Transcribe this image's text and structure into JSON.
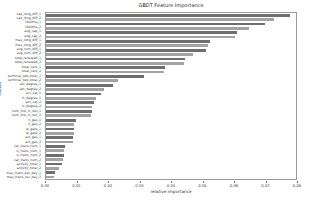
{
  "chart_data": {
    "type": "bar",
    "orientation": "horizontal",
    "title": "GBDT Feature Importance",
    "xlabel": "relative importance",
    "ylabel": "feature",
    "xlim": [
      0,
      0.08
    ],
    "xticks": [
      "0.00",
      "0.01",
      "0.02",
      "0.03",
      "0.04",
      "0.05",
      "0.06",
      "0.07",
      "0.08"
    ],
    "grid": false,
    "legend": "none",
    "bar_colors": [
      "#6f6f6f",
      "#a3a3a3"
    ],
    "categories": [
      "cap_long_diff_1",
      "cap_long_diff_2",
      "lifetime_1",
      "lifetime_2",
      "avg_cap_1",
      "avg_cap_2",
      "max_long_diff_1",
      "max_long_diff_2",
      "avg_turn_diff_1",
      "avg_turn_diff_2",
      "total_renewed_1",
      "total_renewed_2",
      "total_cars_1",
      "total_cars_2",
      "terminal_two_total_1",
      "terminal_two_total_2",
      "act_degree_1",
      "act_degree_2",
      "act_cat_1",
      "in_degree_1",
      "act_cat_2",
      "in_degree_2",
      "num_link_in_out_1",
      "num_link_in_out_2",
      "n_gas_1",
      "n_gas_2",
      "w_gate_1",
      "w_gate_2",
      "act_gas_1",
      "act_gas_2",
      "cat_trans_num_1",
      "si_trans_num_1",
      "si_trans_num_2",
      "cat_trans_num_2",
      "activity_total_1",
      "activity_total_2",
      "max_trans_per_day_1",
      "max_trans_rec_day_2"
    ],
    "values": [
      0.078,
      0.073,
      0.07,
      0.065,
      0.0612,
      0.0605,
      0.0524,
      0.0518,
      0.0512,
      0.047,
      0.0446,
      0.044,
      0.0382,
      0.0376,
      0.0312,
      0.023,
      0.0214,
      0.0185,
      0.0176,
      0.016,
      0.0153,
      0.0148,
      0.0147,
      0.0144,
      0.0096,
      0.0091,
      0.009,
      0.0089,
      0.0086,
      0.0085,
      0.006,
      0.0058,
      0.0057,
      0.0053,
      0.005,
      0.0042,
      0.0029,
      0.0026
    ]
  }
}
